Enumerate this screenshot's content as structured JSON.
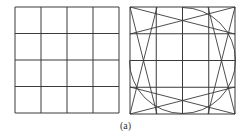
{
  "figure": {
    "caption": "(a)",
    "stroke_color": "#3a3a3a",
    "left_panel": {
      "description": "plain 4x4 grid",
      "rows": 4,
      "cols": 4,
      "x": 15,
      "y": 7,
      "width": 104,
      "height": 106
    },
    "right_panel": {
      "description": "4x4 grid with diagonal strip lines and partial inscribed circle",
      "rows": 4,
      "cols": 4,
      "x": 130,
      "y": 7,
      "width": 105,
      "height": 107,
      "overlay_lines": [
        {
          "x1": 130,
          "y1": 7,
          "x2": 157,
          "y2": 114
        },
        {
          "x1": 157,
          "y1": 7,
          "x2": 130,
          "y2": 114
        },
        {
          "x1": 208,
          "y1": 7,
          "x2": 235,
          "y2": 114
        },
        {
          "x1": 235,
          "y1": 7,
          "x2": 208,
          "y2": 114
        },
        {
          "x1": 130,
          "y1": 7,
          "x2": 235,
          "y2": 34
        },
        {
          "x1": 130,
          "y1": 34,
          "x2": 235,
          "y2": 7
        },
        {
          "x1": 130,
          "y1": 87,
          "x2": 235,
          "y2": 114
        },
        {
          "x1": 130,
          "y1": 114,
          "x2": 235,
          "y2": 87
        }
      ],
      "arc": {
        "cx": 182.5,
        "cy": 60.5,
        "r": 53,
        "start_deg": -90,
        "end_deg": 180,
        "note": "three-quarter circle, top-left quadrant missing"
      }
    }
  }
}
